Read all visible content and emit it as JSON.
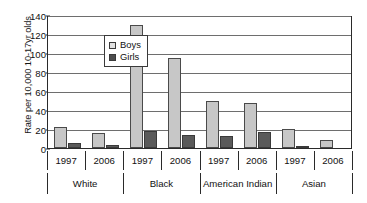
{
  "chart_data": {
    "type": "bar",
    "title": "",
    "subtitle": "",
    "xlabel": "",
    "ylabel": "Rate per 10,000 10-17yr olds",
    "ylim": [
      0,
      140
    ],
    "ytick_step": 20,
    "yticks": [
      0,
      20,
      40,
      60,
      80,
      100,
      120,
      140
    ],
    "ytick_labels": [
      "0",
      "20",
      "40",
      "60",
      "80",
      "100",
      "120",
      "140"
    ],
    "grid": true,
    "grid_axis": "y",
    "legend_position": "top-left-inside",
    "categories": [
      "1997",
      "2006",
      "1997",
      "2006",
      "1997",
      "2006",
      "1997",
      "2006"
    ],
    "group_labels": [
      "White",
      "Black",
      "American Indian",
      "Asian"
    ],
    "groups": [
      {
        "label": "White",
        "years": [
          {
            "year": "1997",
            "boys": 22,
            "girls": 5
          },
          {
            "year": "2006",
            "boys": 16,
            "girls": 3
          }
        ]
      },
      {
        "label": "Black",
        "years": [
          {
            "year": "1997",
            "boys": 129,
            "girls": 18
          },
          {
            "year": "2006",
            "boys": 95,
            "girls": 14
          }
        ]
      },
      {
        "label": "American Indian",
        "years": [
          {
            "year": "1997",
            "boys": 50,
            "girls": 13
          },
          {
            "year": "2006",
            "boys": 47,
            "girls": 17
          }
        ]
      },
      {
        "label": "Asian",
        "years": [
          {
            "year": "1997",
            "boys": 20,
            "girls": 1
          },
          {
            "year": "2006",
            "boys": 8,
            "girls": 0
          }
        ]
      }
    ],
    "series": [
      {
        "name": "Boys",
        "color": "#c7c7c7",
        "values": [
          22,
          16,
          129,
          95,
          50,
          47,
          20,
          8
        ]
      },
      {
        "name": "Girls",
        "color": "#5a5a5a",
        "values": [
          5,
          3,
          18,
          14,
          13,
          17,
          1,
          0
        ]
      }
    ]
  },
  "legend": {
    "items": [
      {
        "label": "Boys",
        "swatch": "boys-swatch-icon"
      },
      {
        "label": "Girls",
        "swatch": "girls-swatch-icon"
      }
    ]
  }
}
